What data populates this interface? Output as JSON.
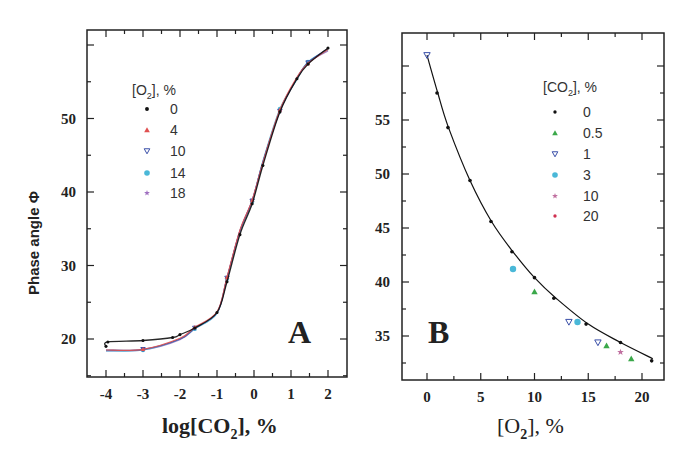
{
  "chart_data": [
    {
      "panel": "A",
      "type": "line",
      "title": "",
      "panel_label": "A",
      "xlabel": "log[CO2], %",
      "ylabel": "Phase angle Φ",
      "xlim": [
        -4.5,
        2.5
      ],
      "ylim": [
        14.8,
        62
      ],
      "x_ticks": [
        -4,
        -3,
        -2,
        -1,
        0,
        1,
        2
      ],
      "y_ticks": [
        20,
        30,
        40,
        50
      ],
      "grid": false,
      "legend": {
        "title": "[O2], %",
        "position": "upper-left",
        "entries": [
          "0",
          "4",
          "10",
          "14",
          "18"
        ]
      },
      "series": [
        {
          "name": "0",
          "color": "#111111",
          "marker": "dot",
          "x": [
            -4.0,
            -3.95,
            -3.0,
            -2.2,
            -2.0,
            -1.6,
            -1.0,
            -0.73,
            -0.38,
            -0.05,
            0.24,
            0.7,
            1.16,
            1.46,
            2.0
          ],
          "y": [
            19.0,
            19.6,
            19.8,
            20.2,
            20.6,
            21.5,
            23.6,
            27.8,
            34.2,
            38.4,
            43.6,
            50.9,
            55.4,
            57.4,
            59.6
          ]
        },
        {
          "name": "4",
          "color": "#e05050",
          "marker": "triangle-up",
          "x": [
            -4.0,
            -3.0,
            -2.0,
            -1.6,
            -1.0,
            -0.73,
            -0.38,
            -0.05,
            0.24,
            0.7,
            1.16,
            1.46,
            2.0
          ],
          "y": [
            18.5,
            18.6,
            20.1,
            21.6,
            23.7,
            28.4,
            34.8,
            38.9,
            44.0,
            51.2,
            55.6,
            57.5,
            59.4
          ]
        },
        {
          "name": "10",
          "color": "#3a4fa8",
          "marker": "triangle-down",
          "x": [
            -4.0,
            -3.0,
            -2.0,
            -1.6,
            -1.0,
            -0.73,
            -0.38,
            -0.05,
            0.24,
            0.7,
            1.16,
            1.46,
            2.0
          ],
          "y": [
            18.5,
            18.6,
            20.0,
            21.5,
            23.6,
            28.3,
            34.7,
            38.8,
            44.1,
            51.0,
            55.5,
            57.6,
            59.5
          ]
        },
        {
          "name": "14",
          "color": "#4ab8d8",
          "marker": "circle",
          "x": [
            -4.0,
            -3.0,
            -2.0,
            -1.6,
            -1.0,
            -0.73,
            -0.38,
            -0.05,
            0.24,
            0.7,
            1.16,
            1.46,
            2.0
          ],
          "y": [
            18.4,
            18.5,
            20.0,
            21.4,
            23.5,
            28.2,
            34.6,
            38.7,
            44.2,
            51.3,
            55.3,
            57.7,
            59.3
          ]
        },
        {
          "name": "18",
          "color": "#a070c0",
          "marker": "star",
          "x": [
            -4.0,
            -3.0,
            -2.0,
            -1.6,
            -1.0,
            -0.73,
            -0.38,
            -0.05,
            0.24,
            0.7,
            1.16,
            1.46,
            2.0
          ],
          "y": [
            18.4,
            18.5,
            19.9,
            21.4,
            23.5,
            28.3,
            34.7,
            38.9,
            44.0,
            51.1,
            55.4,
            57.6,
            59.2
          ]
        }
      ]
    },
    {
      "panel": "B",
      "type": "scatter",
      "title": "",
      "panel_label": "B",
      "xlabel": "[O2], %",
      "ylabel": "",
      "xlim": [
        -2.5,
        22.3
      ],
      "ylim": [
        31.2,
        62.3
      ],
      "x_ticks": [
        0,
        5,
        10,
        15,
        20
      ],
      "y_ticks": [
        35,
        40,
        45,
        50,
        55
      ],
      "grid": false,
      "legend": {
        "title": "[CO2], %",
        "position": "upper-right",
        "entries": [
          "0",
          "0.5",
          "1",
          "3",
          "10",
          "20"
        ]
      },
      "fit_curve": {
        "color": "#111111",
        "x": [
          0,
          1,
          2,
          4,
          6,
          8,
          10,
          12,
          15,
          18,
          21
        ],
        "y": [
          61.0,
          57.5,
          54.3,
          49.4,
          45.6,
          42.8,
          40.4,
          38.5,
          36.1,
          34.4,
          32.9
        ]
      },
      "series": [
        {
          "name": "0",
          "color": "#111111",
          "marker": "dot",
          "x": [
            0.93,
            1.95,
            4.0,
            5.95,
            7.9,
            10.0,
            11.8,
            14.8,
            18.0,
            20.9
          ],
          "y": [
            57.5,
            54.3,
            49.4,
            45.6,
            42.8,
            40.4,
            38.5,
            36.1,
            34.4,
            32.7
          ]
        },
        {
          "name": "0.5",
          "color": "#3aa84a",
          "marker": "triangle-up",
          "x": [
            10.0,
            16.7,
            19.0
          ],
          "y": [
            39.1,
            34.1,
            32.9
          ]
        },
        {
          "name": "1",
          "color": "#3a4fa8",
          "marker": "triangle-down",
          "x": [
            0.0,
            13.2,
            15.9
          ],
          "y": [
            61.0,
            36.3,
            34.4
          ]
        },
        {
          "name": "3",
          "color": "#4ab8d8",
          "marker": "circle",
          "x": [
            8.0,
            14.0
          ],
          "y": [
            41.2,
            36.3
          ]
        },
        {
          "name": "10",
          "color": "#c070a0",
          "marker": "star",
          "x": [
            18.0
          ],
          "y": [
            33.5
          ]
        },
        {
          "name": "20",
          "color": "#d03050",
          "marker": "dot",
          "x": [],
          "y": []
        }
      ]
    }
  ],
  "labels": {
    "ylabel": "Phase angle Φ",
    "panelA_letter": "A",
    "panelB_letter": "B",
    "panelA_xlabel_pre": "log[CO",
    "panelA_xlabel_sub": "2",
    "panelA_xlabel_post": "], %",
    "panelB_xlabel_pre": "[O",
    "panelB_xlabel_sub": "2",
    "panelB_xlabel_post": "], %",
    "legendA_title_pre": "[O",
    "legendA_title_sub": "2",
    "legendA_title_post": "], %",
    "legendB_title_pre": "[CO",
    "legendB_title_sub": "2",
    "legendB_title_post": "], %"
  }
}
